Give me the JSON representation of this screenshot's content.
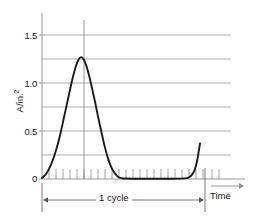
{
  "chart_data": {
    "type": "line",
    "title": "",
    "subtitle": "",
    "xlabel": "Time",
    "ylabel": "A/in.2",
    "ylabel_base": "A/in.",
    "ylabel_exponent": "2",
    "ylim": [
      0,
      1.6
    ],
    "xlim": [
      0,
      1.18
    ],
    "grid": true,
    "gridlines_y": [
      0.25,
      0.5,
      0.75,
      1.0,
      1.25,
      1.5
    ],
    "yticks": [
      0,
      0.5,
      1.0,
      1.5
    ],
    "ytick_labels": [
      "0",
      "0.5",
      "1.0",
      "1.5"
    ],
    "xticks_unlabeled_count": 23,
    "legend": null,
    "legend_position": "none",
    "peak_value": 1.27,
    "peak_x": 0.25,
    "baseline_value": 0.0,
    "tail_end_value": 0.37,
    "annotations": [
      {
        "name": "cycle-span",
        "label": "1 cycle",
        "x_start": 0.0,
        "x_end": 1.0
      },
      {
        "name": "peak-marker",
        "label": "",
        "x": 0.25,
        "y_from": 0.0,
        "y_to": 1.6
      },
      {
        "name": "time-axis-arrow",
        "label": "Time"
      }
    ],
    "series": [
      {
        "name": "A/in.2",
        "color": "#1a1a1a",
        "points": [
          [
            0.0,
            0.01
          ],
          [
            0.02,
            0.04
          ],
          [
            0.04,
            0.09
          ],
          [
            0.06,
            0.16
          ],
          [
            0.08,
            0.25
          ],
          [
            0.1,
            0.36
          ],
          [
            0.12,
            0.49
          ],
          [
            0.14,
            0.64
          ],
          [
            0.16,
            0.79
          ],
          [
            0.18,
            0.94
          ],
          [
            0.2,
            1.08
          ],
          [
            0.215,
            1.17
          ],
          [
            0.232,
            1.24
          ],
          [
            0.25,
            1.27
          ],
          [
            0.268,
            1.24
          ],
          [
            0.285,
            1.17
          ],
          [
            0.3,
            1.08
          ],
          [
            0.32,
            0.94
          ],
          [
            0.34,
            0.79
          ],
          [
            0.36,
            0.63
          ],
          [
            0.38,
            0.48
          ],
          [
            0.4,
            0.34
          ],
          [
            0.42,
            0.22
          ],
          [
            0.44,
            0.13
          ],
          [
            0.46,
            0.07
          ],
          [
            0.48,
            0.03
          ],
          [
            0.5,
            0.012
          ],
          [
            0.53,
            0.005
          ],
          [
            0.6,
            0.003
          ],
          [
            0.7,
            0.003
          ],
          [
            0.8,
            0.003
          ],
          [
            0.88,
            0.004
          ],
          [
            0.93,
            0.012
          ],
          [
            0.955,
            0.04
          ],
          [
            0.975,
            0.1
          ],
          [
            0.99,
            0.195
          ],
          [
            1.0,
            0.29
          ],
          [
            1.008,
            0.37
          ]
        ]
      }
    ],
    "colors": {
      "curve": "#1a1a1a",
      "gridline": "#8c8c8c",
      "axis": "#8c8c8c",
      "text": "#1a1a1a",
      "background": "#ffffff"
    }
  },
  "axis": {
    "ytick_0": "0",
    "ytick_1": "0.5",
    "ytick_2": "1.0",
    "ytick_3": "1.5",
    "ylabel_base": "A/in.",
    "ylabel_exponent": "2",
    "time_label": "Time"
  },
  "annotations": {
    "cycle_label": "1 cycle"
  }
}
